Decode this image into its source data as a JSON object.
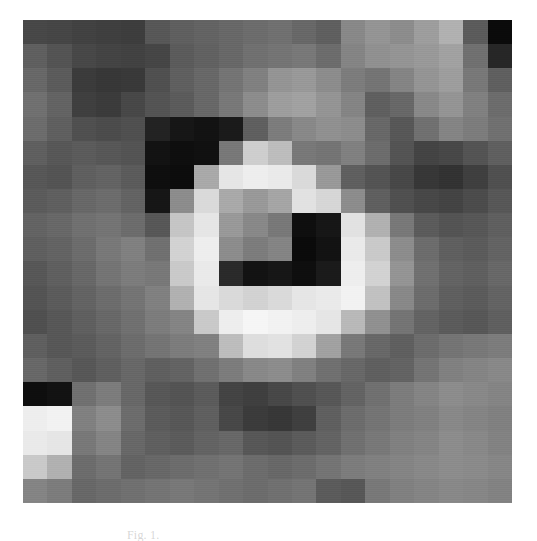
{
  "figure": {
    "kind": "pixelated-grayscale-astronomical-image",
    "caption": "Fig. 1.",
    "panel": {
      "label": "image-panel",
      "grid_cols": 20,
      "grid_rows": 20,
      "background_hex": "#606060"
    },
    "page_background_hex": "#ffffff"
  },
  "chart_data": {
    "type": "heatmap",
    "title": "",
    "subtitle": "",
    "xlabel": "",
    "ylabel": "",
    "colormap": "grayscale",
    "grid": false,
    "legend": "none",
    "nx": 20,
    "ny": 20,
    "vmin": 0,
    "vmax": 255,
    "values": [
      [
        72,
        70,
        66,
        64,
        62,
        88,
        96,
        100,
        104,
        108,
        112,
        104,
        96,
        136,
        148,
        140,
        156,
        176,
        92,
        12
      ],
      [
        96,
        84,
        72,
        68,
        66,
        70,
        92,
        98,
        104,
        112,
        116,
        120,
        108,
        132,
        144,
        148,
        152,
        160,
        112,
        40
      ],
      [
        104,
        92,
        60,
        56,
        58,
        80,
        96,
        104,
        116,
        128,
        148,
        152,
        140,
        124,
        116,
        132,
        148,
        156,
        120,
        96
      ],
      [
        112,
        100,
        64,
        60,
        72,
        84,
        92,
        104,
        120,
        140,
        156,
        160,
        148,
        132,
        96,
        104,
        136,
        148,
        128,
        108
      ],
      [
        108,
        96,
        80,
        76,
        80,
        36,
        24,
        20,
        28,
        96,
        124,
        136,
        144,
        140,
        104,
        88,
        112,
        132,
        124,
        112
      ],
      [
        96,
        88,
        92,
        88,
        84,
        20,
        16,
        18,
        120,
        204,
        188,
        120,
        116,
        128,
        108,
        84,
        68,
        72,
        84,
        96
      ],
      [
        88,
        84,
        96,
        100,
        92,
        16,
        14,
        168,
        228,
        236,
        232,
        216,
        152,
        96,
        84,
        72,
        56,
        52,
        64,
        80
      ],
      [
        92,
        96,
        104,
        108,
        100,
        24,
        140,
        216,
        168,
        152,
        164,
        224,
        212,
        140,
        96,
        80,
        72,
        68,
        76,
        88
      ],
      [
        100,
        104,
        112,
        116,
        108,
        88,
        196,
        228,
        152,
        136,
        120,
        16,
        24,
        224,
        176,
        120,
        92,
        84,
        88,
        96
      ],
      [
        96,
        100,
        108,
        120,
        128,
        112,
        208,
        236,
        140,
        124,
        132,
        12,
        20,
        232,
        200,
        140,
        108,
        96,
        92,
        100
      ],
      [
        88,
        96,
        104,
        116,
        124,
        120,
        200,
        232,
        44,
        20,
        24,
        16,
        28,
        236,
        208,
        148,
        112,
        100,
        96,
        104
      ],
      [
        84,
        92,
        100,
        108,
        116,
        128,
        176,
        228,
        216,
        208,
        216,
        228,
        232,
        240,
        192,
        136,
        108,
        96,
        92,
        100
      ],
      [
        80,
        88,
        96,
        104,
        112,
        124,
        132,
        200,
        236,
        244,
        240,
        236,
        228,
        184,
        144,
        116,
        100,
        92,
        88,
        96
      ],
      [
        96,
        88,
        92,
        100,
        108,
        116,
        124,
        128,
        188,
        220,
        224,
        208,
        160,
        120,
        104,
        96,
        108,
        116,
        120,
        124
      ],
      [
        104,
        96,
        88,
        96,
        104,
        96,
        100,
        112,
        124,
        136,
        140,
        128,
        112,
        104,
        96,
        100,
        116,
        128,
        132,
        136
      ],
      [
        16,
        20,
        112,
        124,
        104,
        88,
        84,
        92,
        68,
        64,
        72,
        80,
        88,
        100,
        112,
        124,
        132,
        140,
        136,
        132
      ],
      [
        236,
        240,
        128,
        140,
        108,
        92,
        88,
        96,
        72,
        60,
        56,
        64,
        96,
        108,
        116,
        124,
        128,
        136,
        132,
        128
      ],
      [
        232,
        228,
        120,
        132,
        104,
        96,
        92,
        100,
        104,
        88,
        84,
        92,
        100,
        112,
        120,
        128,
        132,
        140,
        136,
        130
      ],
      [
        200,
        176,
        108,
        116,
        100,
        104,
        108,
        112,
        116,
        108,
        104,
        108,
        116,
        124,
        128,
        132,
        136,
        140,
        138,
        134
      ],
      [
        132,
        124,
        104,
        108,
        112,
        116,
        120,
        116,
        112,
        108,
        112,
        116,
        92,
        88,
        120,
        128,
        132,
        136,
        134,
        130
      ]
    ]
  }
}
